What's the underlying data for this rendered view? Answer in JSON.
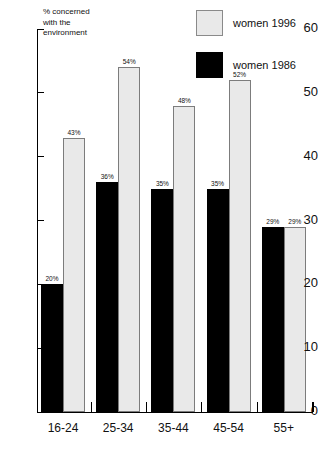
{
  "chart_data": {
    "type": "bar",
    "title": "",
    "xlabel": "",
    "ylabel": "% concerned\nwith the\nenvironment",
    "ylim": [
      0,
      60
    ],
    "yticks": [
      0,
      10,
      20,
      30,
      40,
      50,
      60
    ],
    "ytick_labels": [
      "0",
      "10",
      "20",
      "30",
      "40",
      "50",
      "60"
    ],
    "grid": false,
    "legend_position": "top-right",
    "categories": [
      "16-24",
      "25-34",
      "35-44",
      "45-54",
      "55+"
    ],
    "series": [
      {
        "name": "women 1986",
        "color": "#000000",
        "values": [
          20,
          36,
          35,
          35,
          29
        ],
        "labels": [
          "20%",
          "36%",
          "35%",
          "35%",
          "29%"
        ]
      },
      {
        "name": "women 1996",
        "color": "#e9e9e9",
        "values": [
          43,
          54,
          48,
          52,
          29
        ],
        "labels": [
          "43%",
          "54%",
          "48%",
          "52%",
          "29%"
        ]
      }
    ]
  },
  "legend": {
    "items": [
      {
        "label": "women 1996",
        "swatch": "light"
      },
      {
        "label": "women 1986",
        "swatch": "dark"
      }
    ]
  }
}
